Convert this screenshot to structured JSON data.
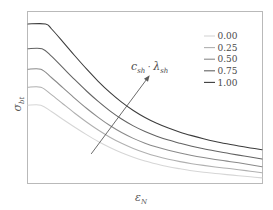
{
  "chart_data": {
    "type": "line",
    "title": "",
    "subtitle": "",
    "xlabel": "ε",
    "xlabel_sub": "N",
    "ylabel": "σ",
    "ylabel_sub": "bt",
    "xlim": [
      0,
      1
    ],
    "ylim": [
      0,
      1
    ],
    "grid": false,
    "xticks": [],
    "yticks": [],
    "legend": {
      "position": "upper-right",
      "title": "",
      "entries": [
        {
          "label": "0.00",
          "color": "#d6d6d6"
        },
        {
          "label": "0.25",
          "color": "#b0b0b0"
        },
        {
          "label": "0.50",
          "color": "#8a8a8a"
        },
        {
          "label": "0.75",
          "color": "#636363"
        },
        {
          "label": "1.00",
          "color": "#3c3c3c"
        }
      ]
    },
    "annotations": [
      {
        "name": "trend-arrow-label",
        "text": "c",
        "text_sub1": "sh",
        "text_mid": "·",
        "text2": "λ",
        "text_sub2": "sh",
        "full": "c_sh · λ_sh"
      }
    ],
    "arrow": {
      "x_start": 0.27,
      "y_start": 0.17,
      "x_end": 0.52,
      "y_end": 0.63,
      "direction": "up-right"
    },
    "series": [
      {
        "name": "0.00",
        "value": 0.0,
        "color": "#d6d6d6",
        "plateau_end_x": 0.055,
        "y0": 0.455,
        "y_end": 0.03,
        "x": [
          0.0,
          0.055,
          0.1,
          0.15,
          0.2,
          0.25,
          0.3,
          0.35,
          0.4,
          0.45,
          0.5,
          0.55,
          0.6,
          0.65,
          0.7,
          0.75,
          0.8,
          0.85,
          0.9,
          0.95,
          1.0
        ],
        "y": [
          0.455,
          0.455,
          0.418,
          0.371,
          0.326,
          0.283,
          0.243,
          0.208,
          0.177,
          0.151,
          0.129,
          0.111,
          0.095,
          0.083,
          0.072,
          0.063,
          0.056,
          0.049,
          0.043,
          0.036,
          0.03
        ]
      },
      {
        "name": "0.25",
        "value": 0.25,
        "color": "#b0b0b0",
        "plateau_end_x": 0.055,
        "y0": 0.56,
        "y_end": 0.06,
        "x": [
          0.0,
          0.055,
          0.1,
          0.15,
          0.2,
          0.25,
          0.3,
          0.35,
          0.4,
          0.45,
          0.5,
          0.55,
          0.6,
          0.65,
          0.7,
          0.75,
          0.8,
          0.85,
          0.9,
          0.95,
          1.0
        ],
        "y": [
          0.56,
          0.56,
          0.517,
          0.462,
          0.408,
          0.357,
          0.31,
          0.268,
          0.232,
          0.202,
          0.177,
          0.156,
          0.139,
          0.125,
          0.113,
          0.103,
          0.094,
          0.086,
          0.078,
          0.069,
          0.06
        ]
      },
      {
        "name": "0.50",
        "value": 0.5,
        "color": "#8a8a8a",
        "plateau_end_x": 0.055,
        "y0": 0.665,
        "y_end": 0.095,
        "x": [
          0.0,
          0.055,
          0.1,
          0.15,
          0.2,
          0.25,
          0.3,
          0.35,
          0.4,
          0.45,
          0.5,
          0.55,
          0.6,
          0.65,
          0.7,
          0.75,
          0.8,
          0.85,
          0.9,
          0.95,
          1.0
        ],
        "y": [
          0.665,
          0.665,
          0.617,
          0.556,
          0.495,
          0.437,
          0.384,
          0.336,
          0.295,
          0.261,
          0.233,
          0.21,
          0.191,
          0.175,
          0.161,
          0.149,
          0.138,
          0.128,
          0.118,
          0.107,
          0.095
        ]
      },
      {
        "name": "0.75",
        "value": 0.75,
        "color": "#636363",
        "plateau_end_x": 0.06,
        "y0": 0.785,
        "y_end": 0.14,
        "x": [
          0.0,
          0.06,
          0.1,
          0.15,
          0.2,
          0.25,
          0.3,
          0.35,
          0.4,
          0.45,
          0.5,
          0.55,
          0.6,
          0.65,
          0.7,
          0.75,
          0.8,
          0.85,
          0.9,
          0.95,
          1.0
        ],
        "y": [
          0.785,
          0.785,
          0.742,
          0.673,
          0.604,
          0.538,
          0.477,
          0.422,
          0.374,
          0.334,
          0.301,
          0.274,
          0.251,
          0.232,
          0.215,
          0.2,
          0.187,
          0.175,
          0.163,
          0.152,
          0.14
        ]
      },
      {
        "name": "1.00",
        "value": 1.0,
        "color": "#3c3c3c",
        "plateau_end_x": 0.075,
        "y0": 0.93,
        "y_end": 0.195,
        "x": [
          0.0,
          0.075,
          0.1,
          0.15,
          0.2,
          0.25,
          0.3,
          0.35,
          0.4,
          0.45,
          0.5,
          0.55,
          0.6,
          0.65,
          0.7,
          0.75,
          0.8,
          0.85,
          0.9,
          0.95,
          1.0
        ],
        "y": [
          0.93,
          0.93,
          0.902,
          0.824,
          0.744,
          0.667,
          0.595,
          0.53,
          0.473,
          0.424,
          0.383,
          0.349,
          0.321,
          0.297,
          0.277,
          0.259,
          0.243,
          0.229,
          0.216,
          0.205,
          0.195
        ]
      }
    ]
  },
  "figure": {
    "background_color": "#ffffff",
    "frame_color": "#b9b9b9",
    "text_color": "#4a4a4a"
  }
}
